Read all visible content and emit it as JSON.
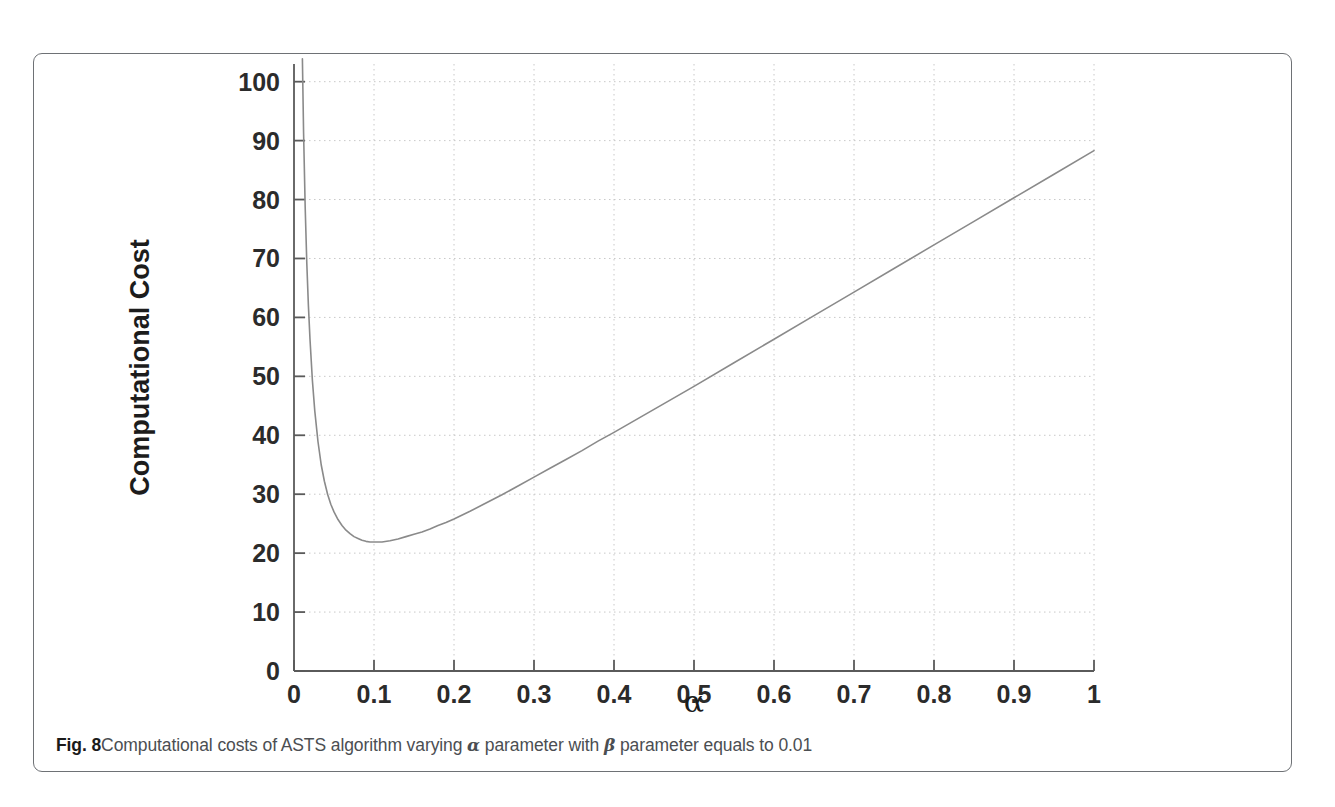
{
  "figure": {
    "caption_label": "Fig. 8",
    "caption_part1": "Computational costs of ASTS algorithm varying ",
    "caption_alpha": "α",
    "caption_part2": " parameter with ",
    "caption_beta": "β",
    "caption_part3": " parameter equals to 0.01",
    "border_color": "#6e7175",
    "background_color": "#ffffff"
  },
  "chart_data": {
    "type": "line",
    "title": "",
    "xlabel": "α",
    "ylabel": "Computational Cost",
    "xlim": [
      0,
      1
    ],
    "ylim": [
      0,
      103
    ],
    "xticks": [
      "0",
      "0.1",
      "0.2",
      "0.3",
      "0.4",
      "0.5",
      "0.6",
      "0.7",
      "0.8",
      "0.9",
      "1"
    ],
    "xtick_values": [
      0,
      0.1,
      0.2,
      0.3,
      0.4,
      0.5,
      0.6,
      0.7,
      0.8,
      0.9,
      1
    ],
    "yticks": [
      "0",
      "10",
      "20",
      "30",
      "40",
      "50",
      "60",
      "70",
      "80",
      "90",
      "100"
    ],
    "ytick_values": [
      0,
      10,
      20,
      30,
      40,
      50,
      60,
      70,
      80,
      90,
      100
    ],
    "grid": true,
    "grid_style": "dotted",
    "grid_color": "#c8c8c8",
    "legend": null,
    "line_color": "#8a8a8a",
    "line_width": 1.6,
    "series": [
      {
        "name": "Computational Cost",
        "x": [
          0.0105,
          0.012,
          0.014,
          0.016,
          0.018,
          0.02,
          0.023,
          0.026,
          0.03,
          0.034,
          0.038,
          0.042,
          0.046,
          0.05,
          0.055,
          0.06,
          0.065,
          0.07,
          0.075,
          0.08,
          0.085,
          0.09,
          0.095,
          0.1,
          0.11,
          0.12,
          0.13,
          0.14,
          0.15,
          0.16,
          0.17,
          0.18,
          0.19,
          0.2,
          0.22,
          0.24,
          0.26,
          0.28,
          0.3,
          0.32,
          0.34,
          0.36,
          0.38,
          0.4,
          0.45,
          0.5,
          0.55,
          0.6,
          0.65,
          0.7,
          0.75,
          0.8,
          0.85,
          0.9,
          0.95,
          1.0
        ],
        "y": [
          103.9,
          91.2,
          78.6,
          69.2,
          62.0,
          56.3,
          49.3,
          44.1,
          38.9,
          35.0,
          32.2,
          30.0,
          28.3,
          27.0,
          25.7,
          24.7,
          23.9,
          23.3,
          22.8,
          22.5,
          22.2,
          22.0,
          21.9,
          21.9,
          21.9,
          22.1,
          22.4,
          22.8,
          23.2,
          23.6,
          24.1,
          24.7,
          25.2,
          25.8,
          27.1,
          28.5,
          29.9,
          31.4,
          32.9,
          34.4,
          35.9,
          37.4,
          39.0,
          40.5,
          44.4,
          48.3,
          52.3,
          56.3,
          60.3,
          64.3,
          68.3,
          72.3,
          76.3,
          80.3,
          84.3,
          88.3
        ]
      }
    ]
  }
}
